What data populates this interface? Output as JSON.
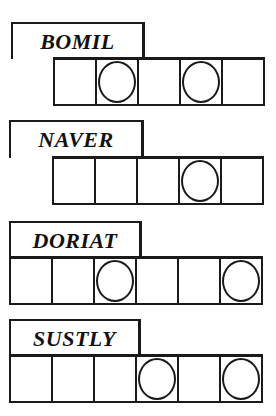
{
  "puzzle": {
    "type": "word-jumble",
    "words": [
      {
        "scrambled": "BOMIL",
        "letter_count": 5,
        "circled_positions": [
          2,
          4
        ]
      },
      {
        "scrambled": "NAVER",
        "letter_count": 5,
        "circled_positions": [
          4
        ]
      },
      {
        "scrambled": "DORIAT",
        "letter_count": 6,
        "circled_positions": [
          3,
          6
        ]
      },
      {
        "scrambled": "SUSTLY",
        "letter_count": 6,
        "circled_positions": [
          4,
          6
        ]
      }
    ]
  },
  "colors": {
    "ink": "#1a1a1a",
    "background": "#ffffff"
  }
}
